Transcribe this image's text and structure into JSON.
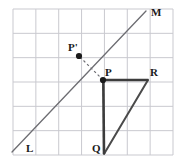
{
  "figure": {
    "kind": "reflection-over-line-geometry-diagram",
    "canvas": {
      "width": 179,
      "height": 168
    },
    "colors": {
      "background": "#ffffff",
      "grid_line": "#c9c9cf",
      "grid_border": "#bdbdc4",
      "mirror_line": "#6d6d72",
      "shape_stroke": "#4a4a4a",
      "shape_dark": "#333333",
      "dash_line": "#6d6d72",
      "point_fill": "#1a1a1a",
      "label_text": "#1a1a1a"
    },
    "grid": {
      "left": 13,
      "top": 9,
      "right": 173,
      "bottom": 155,
      "columns": 7,
      "rows": 6,
      "cell_width": 22.857,
      "cell_height": 24.333,
      "x_lines": [
        13,
        35.86,
        58.71,
        81.57,
        104.43,
        127.29,
        150.14,
        173
      ],
      "y_lines": [
        9,
        33.33,
        57.67,
        82,
        106.33,
        130.67,
        155
      ]
    },
    "mirror_line": {
      "name": "line-LM",
      "from": {
        "x": 12,
        "y": 152
      },
      "to": {
        "x": 146,
        "y": 11
      },
      "endpoint_labels": {
        "start": "L",
        "end": "M"
      }
    },
    "labels": [
      {
        "name": "label-M",
        "text": "M",
        "x": 151,
        "y": 16
      },
      {
        "name": "label-L",
        "text": "L",
        "x": 26,
        "y": 152
      },
      {
        "name": "label-P-prime",
        "text": "P'",
        "x": 68,
        "y": 51
      },
      {
        "name": "label-P",
        "text": "P",
        "x": 105,
        "y": 76
      },
      {
        "name": "label-R",
        "text": "R",
        "x": 150,
        "y": 76
      },
      {
        "name": "label-Q",
        "text": "Q",
        "x": 92,
        "y": 152
      }
    ],
    "points": [
      {
        "name": "point-P-prime",
        "label": "P'",
        "x": 79,
        "y": 56,
        "radius": 3.1,
        "filled": true
      },
      {
        "name": "point-P",
        "label": "P",
        "x": 103,
        "y": 80,
        "radius": 3.1,
        "filled": true
      }
    ],
    "triangle": {
      "name": "triangle-PQR",
      "vertices": [
        {
          "label": "P",
          "x": 103,
          "y": 80
        },
        {
          "label": "R",
          "x": 148,
          "y": 80
        },
        {
          "label": "Q",
          "x": 104,
          "y": 154
        }
      ],
      "edges": [
        {
          "name": "edge-PR",
          "from": "P",
          "to": "R",
          "style": "solid",
          "weight": 2.6
        },
        {
          "name": "edge-PQ",
          "from": "P",
          "to": "Q",
          "style": "solid",
          "weight": 2.6
        },
        {
          "name": "edge-QR",
          "from": "Q",
          "to": "R",
          "style": "solid",
          "weight": 2.0
        }
      ]
    },
    "dashed_segment": {
      "name": "segment-P-prime-to-P",
      "from": {
        "x": 80,
        "y": 57
      },
      "to": {
        "x": 102,
        "y": 79
      },
      "style": "dashed",
      "dash_pattern": "2.5 2.5"
    }
  }
}
